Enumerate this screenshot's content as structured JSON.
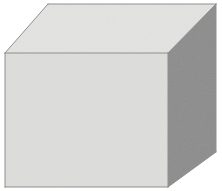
{
  "canvas": {
    "width": 222,
    "height": 191,
    "background_color": "#ffffff"
  },
  "figure": {
    "name": "cube",
    "outline_color": "#8f8f8f",
    "outline_width": 1,
    "faces": [
      {
        "id": "top",
        "label": "top-face",
        "fill_color": "#e3e3e1",
        "points": "5,53 48,4 216,4 168,53"
      },
      {
        "id": "front",
        "label": "front-face",
        "fill_color": "#dddddb",
        "points": "5,53 168,53 168,187 5,187"
      },
      {
        "id": "right",
        "label": "right-face",
        "fill_color": "#8c8c8c",
        "points": "168,53 216,4 216,152 168,187"
      }
    ],
    "edges": [
      {
        "id": "top-back",
        "from": "48,4",
        "to": "216,4"
      },
      {
        "id": "top-left",
        "from": "5,53",
        "to": "48,4"
      },
      {
        "id": "top-front",
        "from": "5,53",
        "to": "168,53"
      },
      {
        "id": "top-right",
        "from": "168,53",
        "to": "216,4"
      },
      {
        "id": "front-left",
        "from": "5,53",
        "to": "5,187"
      },
      {
        "id": "front-bottom",
        "from": "5,187",
        "to": "168,187"
      },
      {
        "id": "vertical-center",
        "from": "168,53",
        "to": "168,187"
      },
      {
        "id": "right-outer",
        "from": "216,4",
        "to": "216,152"
      },
      {
        "id": "right-bottom",
        "from": "216,152",
        "to": "168,187"
      }
    ],
    "vertices": [
      {
        "id": "front-top-left",
        "x": 5,
        "y": 53
      },
      {
        "id": "front-top-right",
        "x": 168,
        "y": 53
      },
      {
        "id": "front-bottom-right",
        "x": 168,
        "y": 187
      },
      {
        "id": "front-bottom-left",
        "x": 5,
        "y": 187
      },
      {
        "id": "back-top-left",
        "x": 48,
        "y": 4
      },
      {
        "id": "back-top-right",
        "x": 216,
        "y": 4
      },
      {
        "id": "back-bottom-right",
        "x": 216,
        "y": 152
      }
    ]
  }
}
